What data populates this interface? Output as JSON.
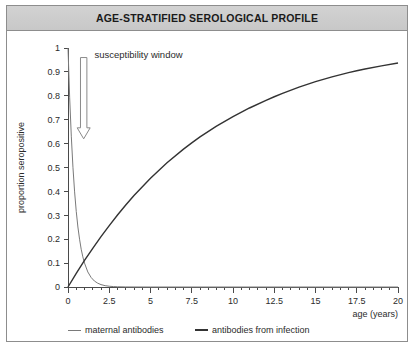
{
  "window": {
    "title": "AGE-STRATIFIED SEROLOGICAL PROFILE",
    "border_color": "#8d8d8d",
    "titlebar_color": "#cccccc",
    "background": "#ffffff"
  },
  "annotations": {
    "susceptibility_label": "susceptibility window",
    "arrow_icon": "down-arrow-icon"
  },
  "legend": {
    "items": [
      {
        "label": "maternal antibodies",
        "color": "#7a7a7a",
        "width": 1
      },
      {
        "label": "antibodies from infection",
        "color": "#333333",
        "width": 2
      }
    ]
  },
  "chart_data": {
    "type": "line",
    "title": "AGE-STRATIFIED SEROLOGICAL PROFILE",
    "xlabel": "age (years)",
    "ylabel": "proportion seropositive",
    "xlim": [
      0,
      20
    ],
    "ylim": [
      0,
      1
    ],
    "grid": false,
    "legend_position": "bottom",
    "xticks": [
      0,
      2.5,
      5,
      7.5,
      10,
      12.5,
      15,
      17.5,
      20
    ],
    "xticklabels": [
      "0",
      "2.5",
      "5",
      "7.5",
      "10",
      "12.5",
      "15",
      "17.5",
      "20"
    ],
    "xminor_step": 0.5,
    "yticks": [
      0,
      0.1,
      0.2,
      0.3,
      0.4,
      0.5,
      0.6,
      0.7,
      0.8,
      0.9,
      1
    ],
    "yticklabels": [
      "0",
      "0.1",
      "0.2",
      "0.3",
      "0.4",
      "0.5",
      "0.6",
      "0.7",
      "0.8",
      "0.9",
      "1"
    ],
    "annotations": [
      {
        "text": "susceptibility window",
        "x": 1.6,
        "y": 0.97
      }
    ],
    "series": [
      {
        "name": "maternal antibodies",
        "color": "#7a7a7a",
        "x": [
          0,
          0.1,
          0.2,
          0.3,
          0.4,
          0.5,
          0.6,
          0.7,
          0.8,
          0.9,
          1,
          1.2,
          1.4,
          1.6,
          1.8,
          2,
          2.25,
          2.5,
          2.75,
          3,
          3.5,
          4,
          5,
          6,
          8,
          10,
          15,
          20
        ],
        "y": [
          1,
          0.794,
          0.631,
          0.501,
          0.398,
          0.316,
          0.251,
          0.2,
          0.158,
          0.126,
          0.1,
          0.063,
          0.04,
          0.025,
          0.016,
          0.01,
          0.0056,
          0.0032,
          0.0018,
          0.001,
          0.0003,
          0.0001,
          0,
          0,
          0,
          0,
          0,
          0
        ]
      },
      {
        "name": "antibodies from infection",
        "color": "#333333",
        "x": [
          0,
          0.5,
          1,
          1.5,
          2,
          2.5,
          3,
          3.5,
          4,
          5,
          6,
          7,
          7.5,
          8,
          9,
          10,
          11,
          12,
          12.5,
          13,
          14,
          15,
          16,
          17,
          17.5,
          18,
          19,
          20
        ],
        "y": [
          0,
          0.057,
          0.111,
          0.162,
          0.211,
          0.257,
          0.301,
          0.343,
          0.383,
          0.455,
          0.52,
          0.577,
          0.603,
          0.628,
          0.673,
          0.713,
          0.749,
          0.781,
          0.796,
          0.81,
          0.836,
          0.859,
          0.879,
          0.897,
          0.905,
          0.912,
          0.925,
          0.937
        ]
      }
    ]
  }
}
